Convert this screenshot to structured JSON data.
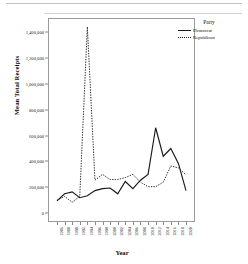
{
  "chart_data": {
    "type": "line",
    "title": "",
    "xlabel": "Year",
    "ylabel": "Mean Total Receipts",
    "legend_title": "Party",
    "legend_position": "top-right",
    "grid": false,
    "ylim": [
      -60000,
      1500000
    ],
    "yticks": [
      0,
      200000,
      400000,
      600000,
      800000,
      1000000,
      1200000,
      1400000
    ],
    "ytick_labels": [
      "0",
      "200,000",
      "400,000",
      "600,000",
      "800,000",
      "1,000,000",
      "1,200,000",
      "1,400,000"
    ],
    "categories": [
      "1986",
      "1988",
      "1990",
      "1992",
      "1994",
      "1996",
      "1998",
      "2000",
      "2002",
      "2004",
      "2006",
      "2008",
      "2010",
      "2012",
      "2014",
      "2016",
      "2018",
      "2020"
    ],
    "series": [
      {
        "name": "Democrat",
        "style": "solid",
        "color": "#1a1a1a",
        "values": [
          95000,
          150000,
          165000,
          120000,
          135000,
          175000,
          190000,
          195000,
          150000,
          245000,
          190000,
          255000,
          300000,
          660000,
          440000,
          500000,
          385000,
          175000
        ]
      },
      {
        "name": "Republican",
        "style": "dotted",
        "color": "#1a1a1a",
        "values": [
          100000,
          130000,
          85000,
          130000,
          1440000,
          255000,
          300000,
          260000,
          260000,
          275000,
          300000,
          240000,
          205000,
          205000,
          240000,
          365000,
          350000,
          295000
        ]
      }
    ]
  },
  "legend": {
    "title": "Party",
    "entries": [
      {
        "label": "Democrat",
        "style": "solid"
      },
      {
        "label": "Republican",
        "style": "dotted"
      }
    ]
  },
  "axes": {
    "x_title": "Year",
    "y_title": "Mean Total Receipts"
  }
}
